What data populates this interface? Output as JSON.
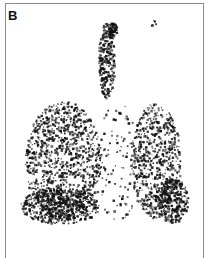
{
  "figure": {
    "panel_label": "B",
    "colors": {
      "background": "#ffffff",
      "border": "#8a8a8a",
      "counts": "#111111"
    }
  },
  "scan_regions": [
    {
      "name": "right-lung",
      "cx": 62,
      "cy": 160,
      "rx": 38,
      "ry": 60,
      "density": 1100,
      "seed": 11
    },
    {
      "name": "right-lung-base",
      "cx": 60,
      "cy": 205,
      "rx": 40,
      "ry": 18,
      "density": 500,
      "seed": 17
    },
    {
      "name": "left-lung",
      "cx": 155,
      "cy": 160,
      "rx": 25,
      "ry": 58,
      "density": 650,
      "seed": 23
    },
    {
      "name": "left-lung-base",
      "cx": 172,
      "cy": 200,
      "rx": 16,
      "ry": 22,
      "density": 300,
      "seed": 29
    },
    {
      "name": "trachea",
      "cx": 106,
      "cy": 60,
      "rx": 8,
      "ry": 38,
      "density": 260,
      "seed": 31
    },
    {
      "name": "trachea-top",
      "cx": 112,
      "cy": 30,
      "rx": 5,
      "ry": 8,
      "density": 90,
      "seed": 37
    },
    {
      "name": "mediastinum-scatter",
      "cx": 118,
      "cy": 160,
      "rx": 25,
      "ry": 60,
      "density": 120,
      "seed": 41
    },
    {
      "name": "upper-right-speck",
      "cx": 153,
      "cy": 23,
      "rx": 4,
      "ry": 3,
      "density": 8,
      "seed": 43
    }
  ]
}
